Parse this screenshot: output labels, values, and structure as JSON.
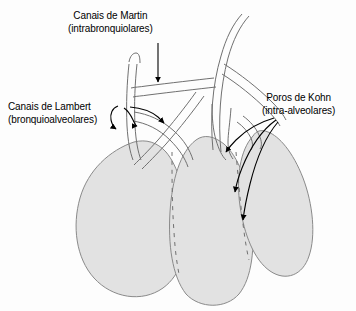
{
  "figure": {
    "background_color": "#fdfdfd",
    "sac_fill_color": "#e2e2e2",
    "sac_stroke_color": "#8a8a8a",
    "airway_stroke_color": "#707070",
    "arrow_color": "#000000",
    "text_color": "#000000"
  },
  "labels": {
    "martin": {
      "line1": "Canais de Martin",
      "line2": "(intrabronquiolares)"
    },
    "lambert": {
      "line1": "Canais de Lambert",
      "line2": "(bronquioalveolares)"
    },
    "kohn": {
      "line1": "Poros de Kohn",
      "line2": "(intra-alveolares)"
    }
  },
  "structures": {
    "alveolar_sacs": [
      {
        "name": "left-alveolar-sac"
      },
      {
        "name": "middle-alveolar-sac"
      },
      {
        "name": "right-alveolar-sac"
      }
    ],
    "airways": [
      {
        "name": "main-bronchiole-trunk"
      },
      {
        "name": "left-bronchiole-branch"
      },
      {
        "name": "right-bronchiole-branch"
      }
    ],
    "pointer_arrows": [
      {
        "name": "martin-arrow",
        "count": 1
      },
      {
        "name": "lambert-arrow",
        "count": 3
      },
      {
        "name": "kohn-arrow",
        "count": 3
      }
    ]
  }
}
